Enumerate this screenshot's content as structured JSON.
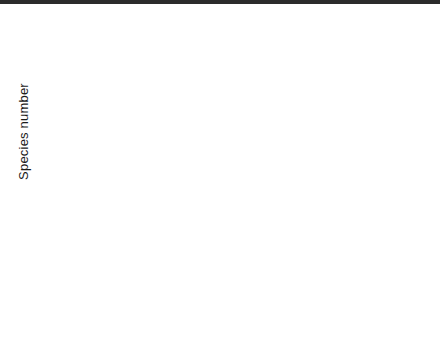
{
  "figure": {
    "ylabel": "Species number"
  },
  "axis": {
    "yticks": [
      0,
      5,
      10,
      15,
      20,
      25,
      30,
      35,
      40,
      45,
      50
    ],
    "ymin": 0,
    "ymax": 50,
    "xcategories": [
      "open",
      "dominant"
    ]
  },
  "legend": {
    "items": [
      {
        "glyph": "median-square-icon",
        "label": "Median"
      },
      {
        "glyph": "iqr-box-icon",
        "label": "25–75%"
      },
      {
        "glyph": "whisker-icon",
        "label": "10–90%"
      },
      {
        "glyph": "outlier-circle-icon",
        "label": "Outliers"
      },
      {
        "glyph": "extreme-cross-icon",
        "label": "Extremes"
      }
    ]
  },
  "chart_data": {
    "type": "box",
    "title": "",
    "xlabel": "",
    "ylabel": "Species number",
    "ylim": [
      0,
      50
    ],
    "ytick_step": 5,
    "grid": false,
    "legend_position": "bottom-right",
    "panels": [
      {
        "title": "Managed grasslands",
        "row": 0,
        "col": 0,
        "groups": [
          {
            "name": "open",
            "q1": 21,
            "q3": 29,
            "median": 24,
            "whisker_low": 13,
            "whisker_high": 35,
            "outliers": [
              8,
              46
            ],
            "extremes": []
          },
          {
            "name": "dominant",
            "q1": 17,
            "q3": 30,
            "median": 26,
            "whisker_low": null,
            "whisker_high": null,
            "outliers": [],
            "extremes": []
          }
        ]
      },
      {
        "title": "Ruderal grasslands",
        "row": 0,
        "col": 1,
        "groups": [
          {
            "name": "open",
            "q1": 17,
            "q3": 30,
            "median": 23,
            "whisker_low": 13,
            "whisker_high": 38,
            "outliers": [],
            "extremes": []
          },
          {
            "name": "dominant",
            "q1": 15,
            "q3": 20,
            "median": 17,
            "whisker_low": 11,
            "whisker_high": 22,
            "outliers": [
              30.5,
              32.5
            ],
            "extremes": []
          }
        ]
      },
      {
        "title": "Tall-herb communities",
        "row": 0,
        "col": 2,
        "groups": [
          {
            "name": "open",
            "q1": 10,
            "q3": 18,
            "median": 13,
            "whisker_low": 7.5,
            "whisker_high": 22,
            "outliers": [],
            "extremes": []
          },
          {
            "name": "dominant",
            "q1": 8.5,
            "q3": 18,
            "median": 12.5,
            "whisker_low": 5,
            "whisker_high": 23,
            "outliers": [],
            "extremes": []
          }
        ]
      },
      {
        "title": "Woodlands",
        "row": 1,
        "col": 0,
        "groups": [
          {
            "name": "open",
            "q1": 13,
            "q3": 20,
            "median": 16,
            "whisker_low": 11,
            "whisker_high": 29.5,
            "outliers": [],
            "extremes": []
          },
          {
            "name": "dominant",
            "q1": 8.5,
            "q3": 15,
            "median": 11.5,
            "whisker_low": 5.5,
            "whisker_high": 15.5,
            "outliers": [],
            "extremes": []
          }
        ]
      },
      {
        "title": "Other open vegetation",
        "row": 1,
        "col": 1,
        "groups": [
          {
            "name": "open",
            "q1": 15,
            "q3": 29,
            "median": 24.5,
            "whisker_low": 12,
            "whisker_high": 36,
            "outliers": [],
            "extremes": []
          },
          {
            "name": "dominant",
            "q1": null,
            "q3": null,
            "median": null,
            "whisker_low": null,
            "whisker_high": null,
            "outliers": [],
            "extremes": []
          }
        ]
      }
    ]
  }
}
